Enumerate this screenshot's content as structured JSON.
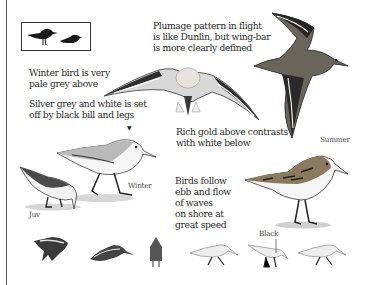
{
  "species_silhouettes": {
    "icon": "two-bird-silhouettes-icon"
  },
  "captions": {
    "flight_pattern": "Plumage pattern in flight\nis like Dunlin, but wing-bar\nis more clearly defined",
    "winter_pale": "Winter bird is very\npale grey above",
    "silver_grey": "Silver grey and white is set\noff by black bill and legs",
    "rich_gold": "Rich gold above contrasts\nwith white below",
    "ebb_flow": "Birds follow\nebb and flow\nof waves\non shore at\ngreat speed"
  },
  "labels": {
    "winter": "Winter",
    "summer": "Summer",
    "juv": "Juv",
    "black": "Black"
  },
  "colors": {
    "ink": "#2b2b2b",
    "wing_dark": "#2e2e2e",
    "grey_back": "#b9b9b9",
    "gold_back": "#8a7a5e",
    "ground": "#cfcfcf"
  }
}
